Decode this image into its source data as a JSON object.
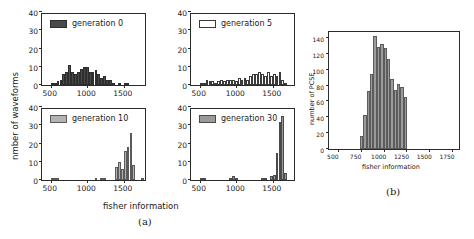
{
  "figure": {
    "panel_a_caption": "(a)",
    "panel_b_caption": "(b)",
    "shared_xlabel": "fisher information",
    "shared_ylabel": "nmber of waveforms"
  },
  "chart_data": [
    {
      "type": "bar",
      "title": "generation 0",
      "legend_label": "generation 0",
      "panel": "a",
      "position": "top-left",
      "xlabel": "fisher information",
      "ylabel": "nmber of waveforms",
      "xlim": [
        380,
        1820
      ],
      "ylim": [
        0,
        40
      ],
      "xticks": [
        500,
        1000,
        1500
      ],
      "yticks": [
        0,
        10,
        20,
        30,
        40
      ],
      "grid": false,
      "bin_width": 40,
      "bin_starts": [
        500,
        540,
        580,
        620,
        660,
        700,
        740,
        780,
        820,
        860,
        900,
        940,
        980,
        1020,
        1060,
        1100,
        1140,
        1180,
        1220,
        1260,
        1300,
        1340,
        1420,
        1500,
        1540
      ],
      "values": [
        1,
        1,
        2,
        3,
        6,
        7,
        11,
        7,
        6,
        7,
        9,
        10,
        10,
        7,
        7,
        8,
        6,
        4,
        5,
        3,
        3,
        1,
        1,
        1,
        1
      ],
      "series_color": "#4a4a4a"
    },
    {
      "type": "bar",
      "title": "generation 5",
      "legend_label": "generation 5",
      "panel": "a",
      "position": "top-right",
      "xlabel": "fisher information",
      "ylabel": "nmber of waveforms",
      "xlim": [
        380,
        1820
      ],
      "ylim": [
        0,
        40
      ],
      "xticks": [
        500,
        1000,
        1500
      ],
      "yticks": [
        0,
        10,
        20,
        30,
        40
      ],
      "grid": false,
      "bin_width": 40,
      "bin_starts": [
        500,
        540,
        580,
        620,
        660,
        700,
        740,
        780,
        820,
        860,
        900,
        940,
        980,
        1020,
        1060,
        1100,
        1140,
        1180,
        1220,
        1260,
        1300,
        1340,
        1380,
        1420,
        1460,
        1500,
        1540,
        1580,
        1620,
        1660
      ],
      "values": [
        1,
        1,
        3,
        2,
        2,
        1,
        2,
        3,
        2,
        3,
        3,
        3,
        2,
        4,
        3,
        4,
        3,
        5,
        6,
        6,
        7,
        6,
        5,
        7,
        5,
        6,
        5,
        7,
        3,
        1
      ],
      "series_color": "#ffffff"
    },
    {
      "type": "bar",
      "title": "generation 10",
      "legend_label": "generation 10",
      "panel": "a",
      "position": "bottom-left",
      "xlabel": "fisher information",
      "ylabel": "nmber of waveforms",
      "xlim": [
        380,
        1820
      ],
      "ylim": [
        0,
        40
      ],
      "xticks": [
        500,
        1000,
        1500
      ],
      "yticks": [
        0,
        10,
        20,
        30,
        40
      ],
      "grid": false,
      "bin_width": 40,
      "bin_starts": [
        500,
        540,
        580,
        1100,
        1180,
        1220,
        1380,
        1420,
        1460,
        1500,
        1540,
        1580,
        1620,
        1740
      ],
      "values": [
        1,
        1,
        1,
        1,
        1,
        1,
        7,
        10,
        6,
        16,
        18,
        26,
        8,
        1
      ],
      "series_color": "#b3b3b3"
    },
    {
      "type": "bar",
      "title": "generation 30",
      "legend_label": "generation 30",
      "panel": "a",
      "position": "bottom-right",
      "xlabel": "fisher information",
      "ylabel": "nmber of waveforms",
      "xlim": [
        380,
        1820
      ],
      "ylim": [
        0,
        40
      ],
      "xticks": [
        500,
        1000,
        1500
      ],
      "yticks": [
        0,
        10,
        20,
        30,
        40
      ],
      "grid": false,
      "bin_width": 40,
      "bin_starts": [
        500,
        540,
        900,
        940,
        980,
        1340,
        1380,
        1460,
        1500,
        1540,
        1580,
        1620,
        1660
      ],
      "values": [
        1,
        1,
        1,
        2,
        1,
        1,
        1,
        2,
        3,
        15,
        32,
        35,
        4
      ],
      "series_color": "#9a9a9a"
    },
    {
      "type": "bar",
      "title": "",
      "panel": "b",
      "position": "right",
      "xlabel": "fisher information",
      "ylabel": "number of PCSE",
      "xlim": [
        400,
        1850
      ],
      "ylim": [
        0,
        150
      ],
      "xticks": [
        500,
        750,
        1000,
        1250,
        1500,
        1750
      ],
      "yticks": [
        0,
        20,
        40,
        60,
        80,
        100,
        120,
        140
      ],
      "grid": false,
      "bin_width": 37,
      "bin_starts": [
        740,
        777,
        814,
        851,
        888,
        925,
        962,
        999,
        1036,
        1073,
        1110,
        1147,
        1184,
        1221
      ],
      "values": [
        16,
        43,
        73,
        94,
        142,
        129,
        133,
        127,
        114,
        88,
        74,
        82,
        78,
        66
      ],
      "series_color": "#9b9b9b"
    }
  ],
  "panels": {
    "top_left": {
      "legend": "generation 0",
      "swatch_style": "fill-dark"
    },
    "top_right": {
      "legend": "generation 5",
      "swatch_style": "fill-open"
    },
    "bottom_left": {
      "legend": "generation 10",
      "swatch_style": "fill-light"
    },
    "bottom_right": {
      "legend": "generation 30",
      "swatch_style": "fill-mid"
    }
  },
  "axes": {
    "a_yticks": [
      "0",
      "10",
      "20",
      "30",
      "40"
    ],
    "a_xticks": [
      "500",
      "1000",
      "1500"
    ],
    "b_yticks": [
      "0",
      "20",
      "40",
      "60",
      "80",
      "100",
      "120",
      "140"
    ],
    "b_xticks": [
      "500",
      "750",
      "1000",
      "1250",
      "1500",
      "1750"
    ],
    "b_xlabel": "fisher information",
    "b_ylabel": "number of PCSE"
  }
}
